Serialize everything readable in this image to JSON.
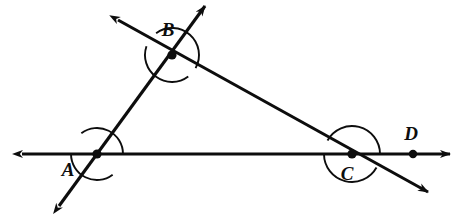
{
  "figure": {
    "type": "geometry-diagram",
    "background_color": "#ffffff",
    "stroke_color": "#0d0d0d",
    "width": 469,
    "height": 215
  },
  "points": [
    {
      "id": "A",
      "label": "A",
      "x": 97,
      "y": 154,
      "dot": true,
      "label_x": 68,
      "label_y": 176
    },
    {
      "id": "B",
      "label": "B",
      "x": 172,
      "y": 55,
      "dot": true,
      "label_x": 168,
      "label_y": 36
    },
    {
      "id": "C",
      "label": "C",
      "x": 352,
      "y": 154,
      "dot": true,
      "label_x": 347,
      "label_y": 180
    },
    {
      "id": "D",
      "label": "D",
      "x": 413,
      "y": 154,
      "dot": true,
      "label_x": 411,
      "label_y": 140
    }
  ],
  "lines": [
    {
      "id": "horizontal-line",
      "name": "line-AD-horizontal",
      "from": {
        "x": 22,
        "y": 154
      },
      "to": {
        "x": 450,
        "y": 154
      },
      "arrow_start": true,
      "arrow_end": true,
      "through": [
        "A",
        "C",
        "D"
      ]
    },
    {
      "id": "line-through-A-B",
      "name": "line-AB-transversal",
      "from": {
        "x": 59,
        "y": 206
      },
      "to": {
        "x": 205,
        "y": 6
      },
      "arrow_start": true,
      "arrow_end": true,
      "through": [
        "A",
        "B"
      ]
    },
    {
      "id": "line-through-B-C",
      "name": "line-BC-transversal",
      "from": {
        "x": 118,
        "y": 20
      },
      "to": {
        "x": 428,
        "y": 192
      },
      "arrow_start": true,
      "arrow_end": true,
      "through": [
        "B",
        "C"
      ]
    }
  ],
  "angle_arcs": [
    {
      "id": "arc-A-upper",
      "vertex": "A",
      "radius": 26,
      "start_deg": 180,
      "end_deg": 307,
      "sweep": "ccw"
    },
    {
      "id": "arc-A-lower",
      "vertex": "A",
      "radius": 26,
      "start_deg": 0,
      "end_deg": 127,
      "sweep": "ccw"
    },
    {
      "id": "arc-B-left",
      "vertex": "B",
      "radius": 27,
      "start_deg": 161,
      "end_deg": 307,
      "sweep": "ccw"
    },
    {
      "id": "arc-B-right",
      "vertex": "B",
      "radius": 27,
      "start_deg": 331,
      "end_deg": 126,
      "sweep": "ccw"
    },
    {
      "id": "arc-C-upper",
      "vertex": "C",
      "radius": 28,
      "start_deg": 0,
      "end_deg": 151,
      "sweep": "ccw"
    },
    {
      "id": "arc-C-lower",
      "vertex": "C",
      "radius": 28,
      "start_deg": 180,
      "end_deg": 331,
      "sweep": "ccw"
    }
  ],
  "labels": {
    "a": "A",
    "b": "B",
    "c": "C",
    "d": "D"
  }
}
